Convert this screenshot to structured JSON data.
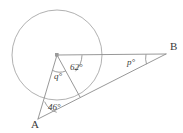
{
  "figure": {
    "background_color": "#ffffff",
    "line_color": "#8c8c8c",
    "circle_color": "#a8a8a8",
    "label_color": "#3a3a3a"
  },
  "points": {
    "center": {
      "name": "O",
      "x": 57,
      "y": 55,
      "marker": "square-dot"
    },
    "a": {
      "label": "A",
      "x": 38,
      "y": 119,
      "label_x": 31,
      "label_y": 128
    },
    "b": {
      "label": "B",
      "x": 166,
      "y": 54,
      "label_x": 170,
      "label_y": 50
    },
    "chord_point": {
      "name": "C",
      "x": 80,
      "y": 97
    },
    "circle_right": {
      "name": "D",
      "x": 103,
      "y": 55
    }
  },
  "circle": {
    "cx": 57,
    "cy": 55,
    "r": 45
  },
  "angles": [
    {
      "id": "angle-62",
      "label": "62°",
      "value": 62,
      "unit": "degrees",
      "vertex": "center",
      "label_x": 70,
      "label_y": 70
    },
    {
      "id": "angle-q",
      "label": "q°",
      "value": "q",
      "unit": "degrees",
      "vertex": "center",
      "label_x": 54,
      "label_y": 79
    },
    {
      "id": "angle-46",
      "label": "46°",
      "value": 46,
      "unit": "degrees",
      "vertex": "a",
      "label_x": 48,
      "label_y": 110
    },
    {
      "id": "angle-p",
      "label": "p°",
      "value": "p",
      "unit": "degrees",
      "vertex": "b",
      "label_x": 127,
      "label_y": 65
    }
  ],
  "segments": [
    {
      "id": "center-to-b",
      "from": "center",
      "to": "b"
    },
    {
      "id": "center-to-a",
      "from": "center",
      "to": "a"
    },
    {
      "id": "center-to-chord",
      "from": "center",
      "to": "chord_point"
    },
    {
      "id": "a-to-b",
      "from": "a",
      "to": "b"
    }
  ]
}
